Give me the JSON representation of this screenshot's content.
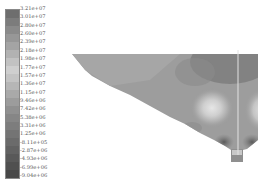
{
  "legend": {
    "labels": [
      "3.21e+07",
      "3.01e+07",
      "2.80e+07",
      "2.60e+07",
      "2.39e+07",
      "2.18e+07",
      "1.98e+07",
      "1.77e+07",
      "1.57e+07",
      "1.36e+07",
      "1.15e+07",
      "9.46e+06",
      "7.42e+06",
      "5.38e+06",
      "3.31e+06",
      "1.25e+06",
      "-8.11e+05",
      "-2.87e+06",
      "-4.93e+06",
      "-6.99e+06",
      "-9.04e+06"
    ],
    "colors": [
      "#6e6e6e",
      "#7c7c7c",
      "#8a8a8a",
      "#979797",
      "#a4a4a4",
      "#b2b2b2",
      "#c2c2c2",
      "#cfcfcf",
      "#c4c4c4",
      "#b6b6b6",
      "#a9a9a9",
      "#9c9c9c",
      "#909090",
      "#868686",
      "#7d7d7d",
      "#747474",
      "#6b6b6b",
      "#626262",
      "#595959",
      "#505050",
      "#474747"
    ]
  },
  "figure": {
    "type": "contour stress plot",
    "shape": "inverted-wedge section with bottom pedestal"
  }
}
